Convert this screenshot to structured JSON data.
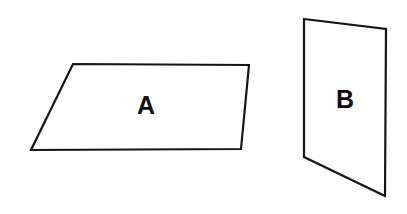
{
  "figure": {
    "title": "Two quadrilateral shapes labelled A and B",
    "canvas": {
      "width": 407,
      "height": 214
    },
    "background_color": "#ffffff",
    "stroke_color": "#141414",
    "stroke_width": 2.2,
    "fill_color": "#ffffff",
    "label_color": "#0d0d0d",
    "shapes": [
      {
        "id": "shape-a",
        "label": "A",
        "kind": "parallelogram",
        "points": "73,64 249,65 241,149 31,150",
        "label_x": 146,
        "label_y": 105
      },
      {
        "id": "shape-b",
        "label": "B",
        "kind": "quadrilateral",
        "points": "304,19 386,29 385,196 304,157",
        "label_x": 345,
        "label_y": 99
      }
    ]
  }
}
